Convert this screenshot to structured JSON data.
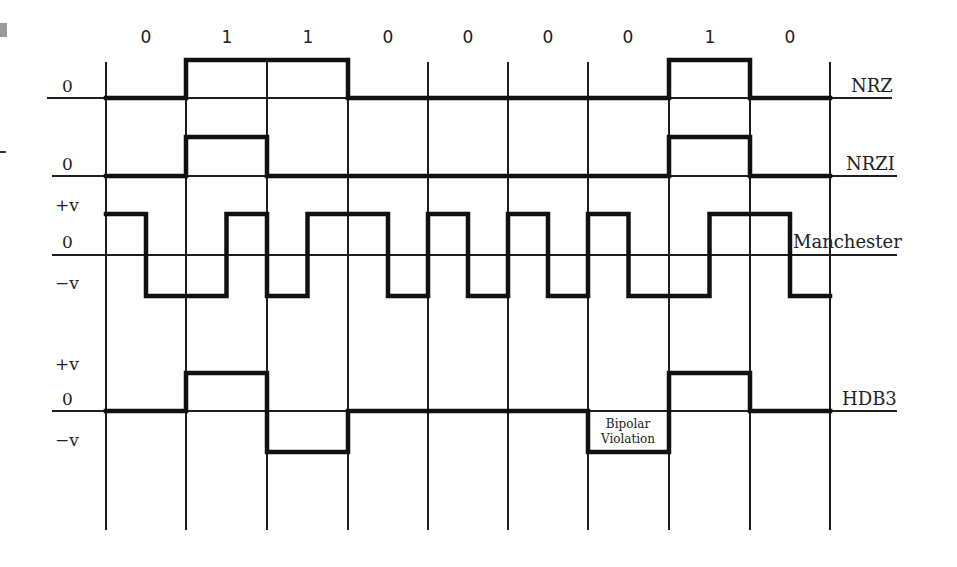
{
  "bits": [
    "0",
    "1",
    "1",
    "0",
    "0",
    "0",
    "0",
    "1",
    "0"
  ],
  "grid": {
    "x_lines": [
      106,
      186,
      267,
      348,
      428,
      508,
      588,
      669,
      750,
      830
    ],
    "top": 62,
    "bottom": 530
  },
  "signals": [
    {
      "name": "NRZ",
      "zero_label": "0",
      "baseline_y": 98,
      "axis_x_start": 47,
      "levels_y": {
        "high": 60,
        "zero": 98
      },
      "segments": [
        "zero",
        "high",
        "high",
        "zero",
        "zero",
        "zero",
        "zero",
        "high",
        "zero"
      ]
    },
    {
      "name": "NRZI",
      "zero_label": "0",
      "baseline_y": 176,
      "axis_x_start": 52,
      "levels_y": {
        "high": 137,
        "zero": 176
      },
      "segments": [
        "zero",
        "high",
        "zero",
        "zero",
        "zero",
        "zero",
        "zero",
        "high",
        "zero"
      ]
    },
    {
      "name": "Manchester",
      "plus_label": "+v",
      "zero_label": "0",
      "minus_label": "−v",
      "baseline_y": 255,
      "axis_x_start": 52,
      "levels_y": {
        "high": 214,
        "zero": 255,
        "low": 296
      },
      "half_bits": [
        "high",
        "low",
        "low",
        "high",
        "low",
        "high",
        "high",
        "low",
        "high",
        "low",
        "high",
        "low",
        "high",
        "low",
        "low",
        "high",
        "high",
        "low"
      ]
    },
    {
      "name": "HDB3",
      "plus_label": "+v",
      "zero_label": "0",
      "minus_label": "−v",
      "baseline_y": 411,
      "axis_x_start": 52,
      "levels_y": {
        "high": 373,
        "zero": 411,
        "low": 452
      },
      "segments": [
        "zero",
        "high",
        "low",
        "zero",
        "zero",
        "zero",
        "low",
        "high",
        "zero"
      ],
      "annotation": {
        "line1": "Bipolar",
        "line2": "Violation",
        "bit_index": 6
      }
    }
  ],
  "colors": {
    "ink": "#111111",
    "background": "#ffffff",
    "corner_mark": "#9a9a9a"
  }
}
